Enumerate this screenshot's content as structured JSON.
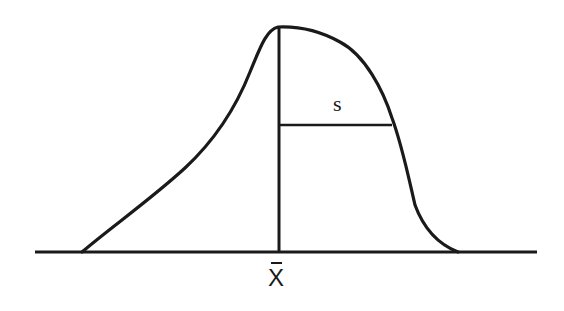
{
  "diagram": {
    "labels": {
      "mean": "X",
      "std_dev": "s"
    },
    "stroke_color": "#1a1a1a",
    "background": "#ffffff"
  }
}
